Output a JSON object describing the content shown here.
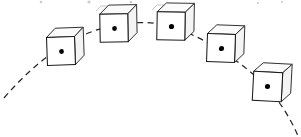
{
  "figure": {
    "description": "A cube-shaped object shown at five successive positions along a dashed parabolic trajectory, with a dot marking the center of mass inside each cube.",
    "background_color": "#ffffff",
    "line_color": "#262626",
    "cube_outline_color": "#1a1a1a",
    "dot_color": "#000000",
    "width": 301,
    "height": 137
  },
  "chart_data": {
    "type": "scatter",
    "xlabel": "",
    "ylabel": "",
    "xlim": [
      0,
      301
    ],
    "ylim": [
      137,
      0
    ],
    "grid": false,
    "legend": "none",
    "series": [
      {
        "name": "center-of-mass trajectory",
        "style": "dashed-parabola",
        "x": [
          5,
          30,
          61,
          90,
          114,
          145,
          171,
          200,
          221,
          247,
          268,
          297
        ],
        "y": [
          96,
          72,
          51,
          38,
          31,
          26,
          26,
          36,
          48,
          70,
          87,
          135
        ]
      },
      {
        "name": "cube center-of-mass positions",
        "style": "marker",
        "x": [
          61,
          114,
          171,
          221,
          268
        ],
        "y": [
          51,
          28,
          26,
          48,
          86
        ]
      }
    ],
    "annotations": [
      {
        "label": "cube-1",
        "x": 61,
        "y": 51
      },
      {
        "label": "cube-2",
        "x": 114,
        "y": 28
      },
      {
        "label": "cube-3",
        "x": 171,
        "y": 26
      },
      {
        "label": "cube-4",
        "x": 221,
        "y": 48
      },
      {
        "label": "cube-5",
        "x": 268,
        "y": 86
      }
    ]
  },
  "trajectory": {
    "name": "dashed-parabolic-path",
    "path": "M 4 98 Q 52 42 106 27 Q 150 16 186 32 Q 232 52 268 88 Q 288 112 298 136",
    "dash_pattern": "6 4.5",
    "stroke_width": 1.25,
    "color": "#262626"
  },
  "cubes": [
    {
      "id": "cube-1",
      "label": "cube-position-1",
      "front": {
        "x": 47,
        "y": 37,
        "w": 28,
        "h": 28
      },
      "depth_x": 9,
      "depth_y": -9,
      "dot": {
        "cx": 61.5,
        "cy": 51.5,
        "r": 2.4
      },
      "tilt": -2
    },
    {
      "id": "cube-2",
      "label": "cube-position-2",
      "front": {
        "x": 100,
        "y": 14,
        "w": 28,
        "h": 28
      },
      "depth_x": 9,
      "depth_y": -9,
      "dot": {
        "cx": 114.5,
        "cy": 28.5,
        "r": 2.4
      },
      "tilt": -1
    },
    {
      "id": "cube-3",
      "label": "cube-position-3",
      "front": {
        "x": 157,
        "y": 12,
        "w": 28,
        "h": 28
      },
      "depth_x": 9,
      "depth_y": -9,
      "dot": {
        "cx": 171.5,
        "cy": 26.5,
        "r": 2.6
      },
      "tilt": 1
    },
    {
      "id": "cube-4",
      "label": "cube-position-4",
      "front": {
        "x": 207,
        "y": 34,
        "w": 28,
        "h": 28
      },
      "depth_x": 9,
      "depth_y": -9,
      "dot": {
        "cx": 221.5,
        "cy": 48.5,
        "r": 2.6
      },
      "tilt": 2
    },
    {
      "id": "cube-5",
      "label": "cube-position-5",
      "front": {
        "x": 253,
        "y": 72,
        "w": 29,
        "h": 29
      },
      "depth_x": 9,
      "depth_y": -9,
      "dot": {
        "cx": 267.5,
        "cy": 86.5,
        "r": 2.6
      },
      "tilt": 3
    }
  ],
  "ghost_marks": {
    "description": "Faint cropped remnants of a row of figures above the visible frame",
    "items": [
      {
        "type": "dot",
        "cx": 41,
        "cy": 2,
        "r": 1.3
      },
      {
        "type": "dot",
        "cx": 89,
        "cy": 2,
        "r": 1.6
      },
      {
        "type": "dot",
        "cx": 131,
        "cy": 2,
        "r": 1.3
      },
      {
        "type": "dot",
        "cx": 258,
        "cy": 3,
        "r": 1.1
      },
      {
        "type": "dot",
        "cx": 282,
        "cy": 2,
        "r": 1.1
      },
      {
        "type": "box-top",
        "d": "M 96 11 L 101 6 L 130 6 L 132 10"
      },
      {
        "type": "box-top",
        "d": "M 152 10 L 157 5 L 183 5 L 186 9 L 186 12"
      }
    ]
  }
}
